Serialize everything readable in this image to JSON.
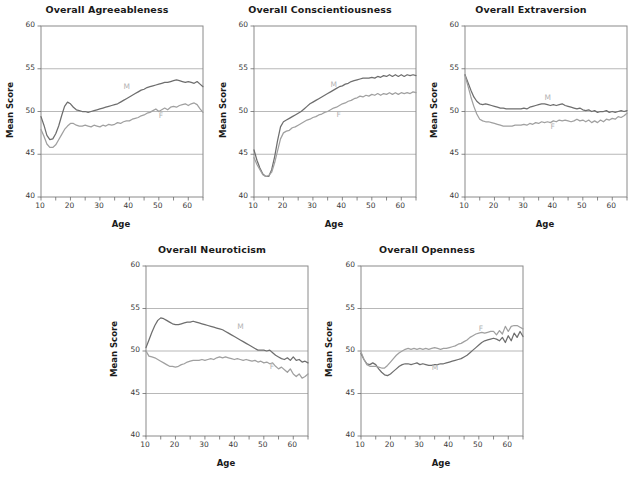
{
  "figure": {
    "axis_titles": {
      "x": "Age",
      "y": "Mean Score"
    },
    "y_ticks": [
      "40",
      "45",
      "50",
      "55",
      "60"
    ],
    "x_ticks": [
      "10",
      "20",
      "30",
      "40",
      "50",
      "60"
    ],
    "series_labels": {
      "male": "M",
      "female": "F"
    },
    "colors": {
      "male_line": "#6e6e6e",
      "female_line": "#a0a0a0",
      "grid": "#9a9a9a",
      "frame": "#8a8a8a",
      "label": "#b4b4b4"
    }
  },
  "chart_data": [
    {
      "id": "agreeableness",
      "type": "line",
      "title": "Overall Agreeableness",
      "xlabel": "Age",
      "ylabel": "Mean Score",
      "xlim": [
        10,
        65
      ],
      "ylim": [
        40,
        60
      ],
      "yticks": [
        40,
        45,
        50,
        55,
        60
      ],
      "xticks": [
        10,
        20,
        30,
        40,
        50,
        60
      ],
      "grid": "horizontal",
      "legend": "inline-curve-labels",
      "x": [
        10,
        11,
        12,
        13,
        14,
        15,
        16,
        17,
        18,
        19,
        20,
        21,
        22,
        23,
        24,
        25,
        26,
        27,
        28,
        29,
        30,
        31,
        32,
        33,
        34,
        35,
        36,
        37,
        38,
        39,
        40,
        41,
        42,
        43,
        44,
        45,
        46,
        47,
        48,
        49,
        50,
        51,
        52,
        53,
        54,
        55,
        56,
        57,
        58,
        59,
        60,
        61,
        62,
        63,
        64,
        65
      ],
      "series": [
        {
          "name": "M",
          "values": [
            49.4,
            48.4,
            47.2,
            46.7,
            46.8,
            47.4,
            48.3,
            49.5,
            50.6,
            51.1,
            50.9,
            50.5,
            50.2,
            50.1,
            50.0,
            50.0,
            49.9,
            50.0,
            50.1,
            50.2,
            50.3,
            50.4,
            50.5,
            50.6,
            50.7,
            50.8,
            50.9,
            51.1,
            51.3,
            51.5,
            51.7,
            51.9,
            52.1,
            52.3,
            52.5,
            52.6,
            52.8,
            52.9,
            53.0,
            53.1,
            53.2,
            53.3,
            53.4,
            53.4,
            53.5,
            53.6,
            53.7,
            53.6,
            53.5,
            53.4,
            53.5,
            53.4,
            53.3,
            53.5,
            53.2,
            52.9
          ]
        },
        {
          "name": "F",
          "values": [
            47.9,
            47.1,
            46.2,
            45.8,
            45.8,
            46.1,
            46.7,
            47.3,
            47.9,
            48.3,
            48.6,
            48.6,
            48.4,
            48.3,
            48.3,
            48.4,
            48.3,
            48.2,
            48.4,
            48.3,
            48.2,
            48.4,
            48.3,
            48.5,
            48.4,
            48.5,
            48.7,
            48.6,
            48.8,
            48.9,
            48.9,
            49.1,
            49.2,
            49.3,
            49.5,
            49.6,
            49.8,
            49.9,
            50.1,
            50.3,
            50.0,
            50.2,
            50.4,
            50.2,
            50.5,
            50.6,
            50.5,
            50.7,
            50.8,
            50.9,
            50.7,
            50.9,
            51.0,
            50.8,
            50.3,
            49.9
          ]
        }
      ]
    },
    {
      "id": "conscientiousness",
      "type": "line",
      "title": "Overall Conscientiousness",
      "xlabel": "Age",
      "ylabel": "Mean Score",
      "xlim": [
        10,
        65
      ],
      "ylim": [
        40,
        60
      ],
      "yticks": [
        40,
        45,
        50,
        55,
        60
      ],
      "xticks": [
        10,
        20,
        30,
        40,
        50,
        60
      ],
      "grid": "horizontal",
      "legend": "inline-curve-labels",
      "x": [
        10,
        11,
        12,
        13,
        14,
        15,
        16,
        17,
        18,
        19,
        20,
        21,
        22,
        23,
        24,
        25,
        26,
        27,
        28,
        29,
        30,
        31,
        32,
        33,
        34,
        35,
        36,
        37,
        38,
        39,
        40,
        41,
        42,
        43,
        44,
        45,
        46,
        47,
        48,
        49,
        50,
        51,
        52,
        53,
        54,
        55,
        56,
        57,
        58,
        59,
        60,
        61,
        62,
        63,
        64,
        65
      ],
      "series": [
        {
          "name": "M",
          "values": [
            45.5,
            44.3,
            43.4,
            42.7,
            42.4,
            42.4,
            43.2,
            44.7,
            46.6,
            48.2,
            48.8,
            49.0,
            49.2,
            49.4,
            49.6,
            49.8,
            50.0,
            50.3,
            50.6,
            50.9,
            51.1,
            51.3,
            51.5,
            51.7,
            51.9,
            52.1,
            52.3,
            52.5,
            52.7,
            52.9,
            53.0,
            53.2,
            53.3,
            53.5,
            53.6,
            53.7,
            53.8,
            53.9,
            53.9,
            53.9,
            54.0,
            53.9,
            54.1,
            54.0,
            54.2,
            54.1,
            54.3,
            54.1,
            54.3,
            54.1,
            54.3,
            54.1,
            54.3,
            54.2,
            54.3,
            54.2
          ]
        },
        {
          "name": "F",
          "values": [
            44.6,
            43.8,
            43.2,
            42.6,
            42.4,
            42.5,
            42.9,
            44.0,
            45.4,
            46.8,
            47.5,
            47.7,
            47.8,
            48.1,
            48.2,
            48.4,
            48.6,
            48.8,
            49.0,
            49.1,
            49.3,
            49.4,
            49.6,
            49.7,
            49.9,
            50.0,
            50.2,
            50.4,
            50.5,
            50.7,
            50.9,
            51.0,
            51.2,
            51.3,
            51.5,
            51.6,
            51.8,
            51.7,
            51.9,
            51.8,
            52.0,
            51.9,
            52.1,
            51.9,
            52.1,
            52.0,
            52.2,
            52.0,
            52.2,
            52.0,
            52.2,
            52.1,
            52.2,
            52.1,
            52.3,
            52.2
          ]
        }
      ]
    },
    {
      "id": "extraversion",
      "type": "line",
      "title": "Overall Extraversion",
      "xlabel": "Age",
      "ylabel": "Mean Score",
      "xlim": [
        10,
        65
      ],
      "ylim": [
        40,
        60
      ],
      "yticks": [
        40,
        45,
        50,
        55,
        60
      ],
      "xticks": [
        10,
        20,
        30,
        40,
        50,
        60
      ],
      "grid": "horizontal",
      "legend": "inline-curve-labels",
      "x": [
        10,
        11,
        12,
        13,
        14,
        15,
        16,
        17,
        18,
        19,
        20,
        21,
        22,
        23,
        24,
        25,
        26,
        27,
        28,
        29,
        30,
        31,
        32,
        33,
        34,
        35,
        36,
        37,
        38,
        39,
        40,
        41,
        42,
        43,
        44,
        45,
        46,
        47,
        48,
        49,
        50,
        51,
        52,
        53,
        54,
        55,
        56,
        57,
        58,
        59,
        60,
        61,
        62,
        63,
        64,
        65
      ],
      "series": [
        {
          "name": "M",
          "values": [
            54.3,
            53.4,
            52.5,
            51.7,
            51.2,
            50.9,
            50.8,
            50.9,
            50.8,
            50.7,
            50.6,
            50.5,
            50.4,
            50.4,
            50.3,
            50.3,
            50.3,
            50.3,
            50.3,
            50.3,
            50.4,
            50.3,
            50.5,
            50.6,
            50.7,
            50.8,
            50.9,
            50.9,
            50.8,
            50.7,
            50.8,
            50.7,
            50.8,
            50.9,
            50.7,
            50.6,
            50.5,
            50.4,
            50.3,
            50.4,
            50.2,
            50.1,
            50.2,
            50.0,
            50.1,
            49.9,
            50.0,
            50.0,
            50.1,
            49.9,
            50.0,
            49.9,
            50.0,
            50.1,
            50.0,
            50.1
          ]
        },
        {
          "name": "F",
          "values": [
            54.2,
            53.0,
            51.7,
            50.6,
            49.7,
            49.1,
            48.9,
            48.8,
            48.8,
            48.7,
            48.6,
            48.5,
            48.4,
            48.3,
            48.3,
            48.3,
            48.3,
            48.4,
            48.4,
            48.4,
            48.5,
            48.4,
            48.6,
            48.5,
            48.7,
            48.6,
            48.8,
            48.7,
            48.8,
            48.7,
            48.9,
            48.8,
            49.0,
            48.9,
            49.0,
            48.9,
            48.8,
            48.9,
            49.1,
            48.9,
            49.0,
            48.8,
            49.0,
            48.7,
            48.9,
            48.7,
            49.0,
            48.8,
            49.1,
            49.0,
            49.2,
            49.1,
            49.4,
            49.3,
            49.5,
            49.8
          ]
        }
      ]
    },
    {
      "id": "neuroticism",
      "type": "line",
      "title": "Overall Neuroticism",
      "xlabel": "Age",
      "ylabel": "Mean Score",
      "xlim": [
        10,
        65
      ],
      "ylim": [
        40,
        60
      ],
      "yticks": [
        40,
        45,
        50,
        55,
        60
      ],
      "xticks": [
        10,
        20,
        30,
        40,
        50,
        60
      ],
      "grid": "horizontal",
      "legend": "inline-curve-labels",
      "x": [
        10,
        11,
        12,
        13,
        14,
        15,
        16,
        17,
        18,
        19,
        20,
        21,
        22,
        23,
        24,
        25,
        26,
        27,
        28,
        29,
        30,
        31,
        32,
        33,
        34,
        35,
        36,
        37,
        38,
        39,
        40,
        41,
        42,
        43,
        44,
        45,
        46,
        47,
        48,
        49,
        50,
        51,
        52,
        53,
        54,
        55,
        56,
        57,
        58,
        59,
        60,
        61,
        62,
        63,
        64,
        65
      ],
      "series": [
        {
          "name": "M",
          "values": [
            50.4,
            51.3,
            52.2,
            53.0,
            53.6,
            53.9,
            53.8,
            53.6,
            53.4,
            53.2,
            53.1,
            53.1,
            53.2,
            53.3,
            53.4,
            53.4,
            53.5,
            53.4,
            53.3,
            53.2,
            53.1,
            53.0,
            52.9,
            52.8,
            52.7,
            52.6,
            52.5,
            52.3,
            52.1,
            51.9,
            51.7,
            51.5,
            51.3,
            51.1,
            50.9,
            50.7,
            50.5,
            50.3,
            50.1,
            50.1,
            50.1,
            50.0,
            50.1,
            49.8,
            49.5,
            49.3,
            49.1,
            49.0,
            49.2,
            48.9,
            49.3,
            48.9,
            49.0,
            48.7,
            48.8,
            48.6
          ]
        },
        {
          "name": "F",
          "values": [
            50.0,
            49.4,
            49.3,
            49.2,
            49.0,
            48.8,
            48.6,
            48.4,
            48.2,
            48.2,
            48.1,
            48.2,
            48.4,
            48.5,
            48.7,
            48.8,
            48.9,
            48.9,
            48.9,
            49.0,
            48.9,
            49.0,
            49.1,
            49.0,
            49.2,
            49.3,
            49.2,
            49.3,
            49.2,
            49.1,
            49.0,
            49.1,
            49.0,
            48.9,
            49.0,
            48.9,
            48.8,
            48.9,
            48.7,
            48.8,
            48.6,
            48.7,
            48.5,
            48.6,
            48.2,
            47.9,
            48.1,
            47.8,
            47.5,
            47.9,
            47.3,
            47.0,
            47.3,
            46.8,
            47.0,
            47.3
          ]
        }
      ]
    },
    {
      "id": "openness",
      "type": "line",
      "title": "Overall Openness",
      "xlabel": "Age",
      "ylabel": "Mean Score",
      "xlim": [
        10,
        65
      ],
      "ylim": [
        40,
        60
      ],
      "yticks": [
        40,
        45,
        50,
        55,
        60
      ],
      "xticks": [
        10,
        20,
        30,
        40,
        50,
        60
      ],
      "grid": "horizontal",
      "legend": "inline-curve-labels",
      "x": [
        10,
        11,
        12,
        13,
        14,
        15,
        16,
        17,
        18,
        19,
        20,
        21,
        22,
        23,
        24,
        25,
        26,
        27,
        28,
        29,
        30,
        31,
        32,
        33,
        34,
        35,
        36,
        37,
        38,
        39,
        40,
        41,
        42,
        43,
        44,
        45,
        46,
        47,
        48,
        49,
        50,
        51,
        52,
        53,
        54,
        55,
        56,
        57,
        58,
        59,
        60,
        61,
        62,
        63,
        64,
        65
      ],
      "series": [
        {
          "name": "M",
          "values": [
            49.7,
            49.0,
            48.5,
            48.4,
            48.6,
            48.4,
            47.9,
            47.5,
            47.2,
            47.1,
            47.3,
            47.6,
            47.9,
            48.2,
            48.4,
            48.5,
            48.5,
            48.4,
            48.5,
            48.6,
            48.4,
            48.5,
            48.4,
            48.3,
            48.3,
            48.4,
            48.4,
            48.5,
            48.5,
            48.6,
            48.7,
            48.8,
            48.9,
            49.0,
            49.1,
            49.3,
            49.5,
            49.8,
            50.1,
            50.4,
            50.7,
            51.0,
            51.2,
            51.3,
            51.4,
            51.5,
            51.4,
            51.2,
            51.6,
            51.0,
            51.8,
            51.2,
            52.1,
            51.6,
            52.3,
            51.7
          ]
        },
        {
          "name": "F",
          "values": [
            49.9,
            49.0,
            48.4,
            48.2,
            48.2,
            48.2,
            48.1,
            48.0,
            48.0,
            48.3,
            48.7,
            49.1,
            49.5,
            49.8,
            50.0,
            50.2,
            50.3,
            50.2,
            50.3,
            50.2,
            50.3,
            50.2,
            50.3,
            50.2,
            50.3,
            50.4,
            50.3,
            50.2,
            50.3,
            50.3,
            50.4,
            50.5,
            50.6,
            50.8,
            50.9,
            51.1,
            51.3,
            51.6,
            51.8,
            52.0,
            52.1,
            52.2,
            52.1,
            52.2,
            52.3,
            52.3,
            51.9,
            52.4,
            52.0,
            52.9,
            52.3,
            52.9,
            53.0,
            53.0,
            52.8,
            52.6
          ]
        }
      ]
    }
  ],
  "curve_label_positions": [
    {
      "id": "agreeableness",
      "m": {
        "x": 38,
        "y": 52.6
      },
      "f": {
        "x": 50,
        "y": 49.2
      }
    },
    {
      "id": "conscientiousness",
      "m": {
        "x": 36,
        "y": 52.9
      },
      "f": {
        "x": 38,
        "y": 49.3
      }
    },
    {
      "id": "extraversion",
      "m": {
        "x": 37,
        "y": 51.4
      },
      "f": {
        "x": 39,
        "y": 47.9
      }
    },
    {
      "id": "neuroticism",
      "m": {
        "x": 41,
        "y": 52.6
      },
      "f": {
        "x": 52,
        "y": 47.9
      }
    },
    {
      "id": "openness",
      "m": {
        "x": 34,
        "y": 47.8
      },
      "f": {
        "x": 50,
        "y": 52.4
      }
    }
  ]
}
